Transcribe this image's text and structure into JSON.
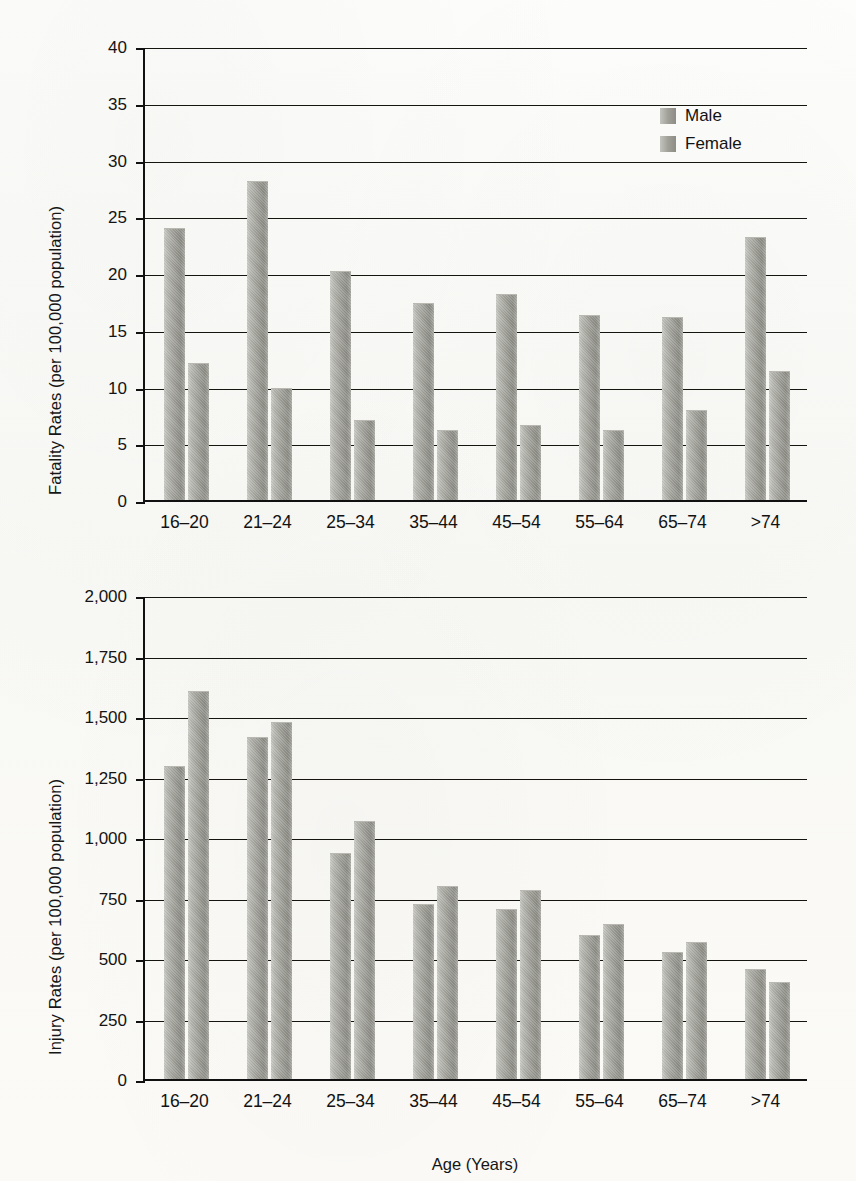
{
  "figure": {
    "xaxis_title": "Age (Years)",
    "legend": [
      {
        "label": "Male",
        "color": "#9a9a93"
      },
      {
        "label": "Female",
        "color": "#9a9a93"
      }
    ]
  },
  "chart_data": [
    {
      "type": "bar",
      "id": "fatality-rates",
      "title": "",
      "ylabel": "Fatality Rates (per 100,000 population)",
      "xlabel": "",
      "ylim": [
        0,
        40
      ],
      "yticks": [
        0,
        5,
        10,
        15,
        20,
        25,
        30,
        35,
        40
      ],
      "ytick_labels": [
        "0",
        "5",
        "10",
        "15",
        "20",
        "25",
        "30",
        "35",
        "40"
      ],
      "grid": true,
      "legend_position": "upper right",
      "categories": [
        "16–20",
        "21–24",
        "25–34",
        "35–44",
        "45–54",
        "55–64",
        "65–74",
        ">74"
      ],
      "series": [
        {
          "name": "Male",
          "values": [
            23.9,
            28.0,
            20.1,
            17.3,
            18.1,
            16.2,
            16.0,
            23.1
          ]
        },
        {
          "name": "Female",
          "values": [
            12.0,
            9.8,
            7.0,
            6.1,
            6.5,
            6.1,
            7.8,
            11.3
          ]
        }
      ]
    },
    {
      "type": "bar",
      "id": "injury-rates",
      "title": "",
      "ylabel": "Injury Rates (per 100,000 population)",
      "xlabel": "Age (Years)",
      "ylim": [
        0,
        2000
      ],
      "yticks": [
        0,
        250,
        500,
        750,
        1000,
        1250,
        1500,
        1750,
        2000
      ],
      "ytick_labels": [
        "0",
        "250",
        "500",
        "750",
        "1,000",
        "1,250",
        "1,500",
        "1,750",
        "2,000"
      ],
      "grid": true,
      "legend_position": "none",
      "categories": [
        "16–20",
        "21–24",
        "25–34",
        "35–44",
        "45–54",
        "55–64",
        "65–74",
        ">74"
      ],
      "series": [
        {
          "name": "Male",
          "values": [
            1290,
            1410,
            930,
            720,
            700,
            590,
            520,
            450
          ]
        },
        {
          "name": "Female",
          "values": [
            1600,
            1470,
            1060,
            795,
            775,
            635,
            560,
            395
          ]
        }
      ]
    }
  ]
}
